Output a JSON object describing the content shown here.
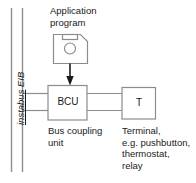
{
  "diagram": {
    "bus": {
      "label_prefix": "instabus",
      "label_suffix": " EIB",
      "name": "instabus EIB"
    },
    "nodes": {
      "application_program": {
        "label_line1": "Application",
        "label_line2": "program",
        "icon": "floppy-disk-icon"
      },
      "bcu": {
        "abbr": "BCU",
        "desc_line1": "Bus coupling",
        "desc_line2": "unit"
      },
      "terminal": {
        "abbr": "T",
        "desc_line1": "Terminal,",
        "desc_line2": "e.g. pushbutton,",
        "desc_line3": "thermostat,",
        "desc_line4": "relay"
      }
    },
    "colors": {
      "line": "#808080",
      "text": "#1a1a1a",
      "arrow": "#1a1a1a",
      "background": "#ffffff"
    }
  }
}
